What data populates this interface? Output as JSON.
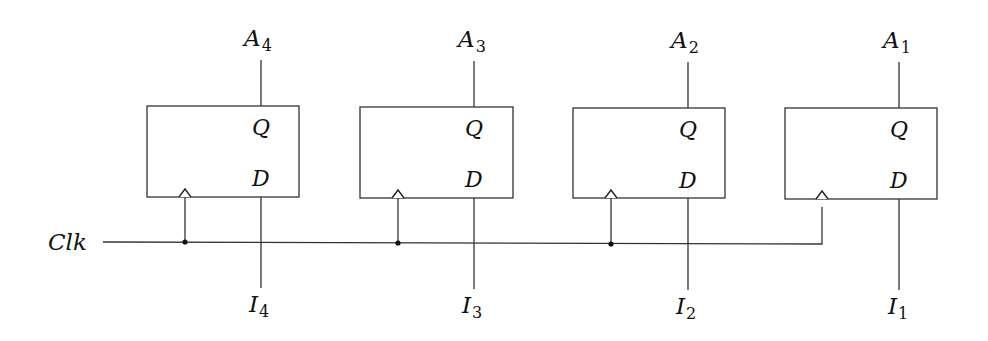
{
  "diagram": {
    "type": "4-bit parallel register (D flip-flops)",
    "clock_label": "Clk",
    "flipflops": [
      {
        "id": "ff4",
        "output_label": "A",
        "output_sub": "4",
        "input_label": "I",
        "input_sub": "4",
        "q_pin": "Q",
        "d_pin": "D"
      },
      {
        "id": "ff3",
        "output_label": "A",
        "output_sub": "3",
        "input_label": "I",
        "input_sub": "3",
        "q_pin": "Q",
        "d_pin": "D"
      },
      {
        "id": "ff2",
        "output_label": "A",
        "output_sub": "2",
        "input_label": "I",
        "input_sub": "2",
        "q_pin": "Q",
        "d_pin": "D"
      },
      {
        "id": "ff1",
        "output_label": "A",
        "output_sub": "1",
        "input_label": "I",
        "input_sub": "1",
        "q_pin": "Q",
        "d_pin": "D"
      }
    ],
    "colors": {
      "line": "#333333",
      "text": "#111111",
      "background": "#ffffff"
    }
  }
}
